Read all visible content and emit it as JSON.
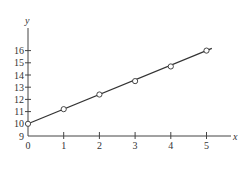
{
  "chart_data": {
    "type": "line",
    "title": "",
    "xlabel": "x",
    "ylabel": "y",
    "x": [
      0,
      1,
      2,
      3,
      4,
      5
    ],
    "series": [
      {
        "name": "data points",
        "values": [
          10.0,
          11.2,
          12.4,
          13.5,
          14.7,
          16.0
        ],
        "marker": "open-circle"
      },
      {
        "name": "fitted line",
        "values": [
          10.0,
          11.2,
          12.4,
          13.6,
          14.8,
          16.0
        ],
        "marker": "none",
        "x_end": 5.15
      }
    ],
    "xticks": [
      "0",
      "1",
      "2",
      "3",
      "4",
      "5"
    ],
    "yticks": [
      "9",
      "10",
      "11",
      "12",
      "13",
      "14",
      "15",
      "16"
    ],
    "xlim": [
      0,
      5.6
    ],
    "ylim": [
      9,
      17
    ],
    "grid": false,
    "legend": "none"
  },
  "colors": {
    "axis": "#444444",
    "line": "#333333",
    "marker_fill": "#ffffff"
  }
}
